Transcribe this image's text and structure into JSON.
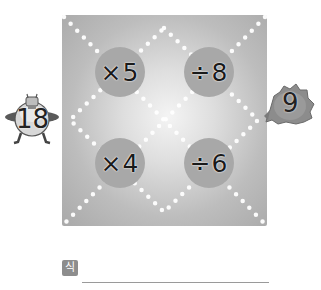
{
  "puzzle": {
    "start_number": "18",
    "end_number": "9",
    "operations": [
      {
        "label": "×5",
        "position": "top-left"
      },
      {
        "label": "÷8",
        "position": "top-right"
      },
      {
        "label": "×4",
        "position": "bottom-left"
      },
      {
        "label": "÷6",
        "position": "bottom-right"
      }
    ]
  },
  "answer": {
    "formula_label": "식",
    "value": ""
  },
  "colors": {
    "board_center": "#f4f4f4",
    "board_edge": "#a9a9a9",
    "op_circle": "#a8a8a8",
    "dots": "#ffffff",
    "badge": "#8d8d8d"
  }
}
